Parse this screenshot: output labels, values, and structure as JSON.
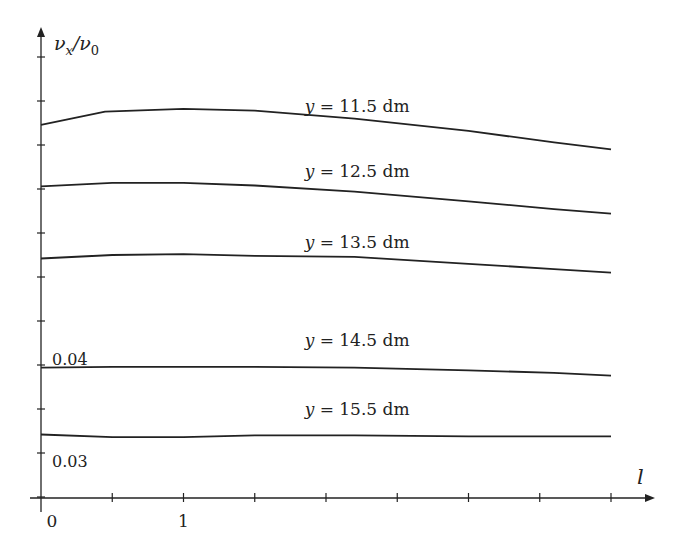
{
  "chart_data": {
    "type": "line",
    "title": "",
    "xlabel": "l",
    "ylabel": "v_x/v_0",
    "ylabel_parts": {
      "num": "ν",
      "num_sub": "x",
      "den": "ν",
      "den_sub": "0"
    },
    "x_tick_labels": [
      {
        "value": 0,
        "label": "0"
      },
      {
        "value": 1,
        "label": "1"
      }
    ],
    "x_ticks": [
      0.5,
      1,
      1.5,
      2,
      2.5,
      3,
      3.5,
      4
    ],
    "y_tick_labels": [
      {
        "value": 0.04,
        "label": "0.04"
      },
      {
        "value": 0.03,
        "label": "0.03"
      }
    ],
    "y_ticks": [
      0.025,
      0.03,
      0.035,
      0.04,
      0.045,
      0.05,
      0.055,
      0.06,
      0.065,
      0.07,
      0.075
    ],
    "xlim": [
      -0.1,
      4.45
    ],
    "ylim": [
      0.0236,
      0.0763
    ],
    "grid": false,
    "legend": "inline labels",
    "series": [
      {
        "name": "y = 11.5 dm",
        "label_pos": {
          "x": 1.85,
          "y": 0.0688
        },
        "x": [
          0,
          0.45,
          1.0,
          1.5,
          2.2,
          3.0,
          3.6,
          4.0
        ],
        "y": [
          0.0673,
          0.0688,
          0.0691,
          0.0689,
          0.068,
          0.0666,
          0.0653,
          0.0645
        ]
      },
      {
        "name": "y = 12.5 dm",
        "label_pos": {
          "x": 1.85,
          "y": 0.0614
        },
        "x": [
          0,
          0.5,
          1.0,
          1.5,
          2.2,
          3.0,
          3.6,
          4.0
        ],
        "y": [
          0.0603,
          0.0607,
          0.0607,
          0.0604,
          0.0597,
          0.0586,
          0.0577,
          0.0572
        ]
      },
      {
        "name": "y = 13.5 dm",
        "label_pos": {
          "x": 1.85,
          "y": 0.0533
        },
        "x": [
          0,
          0.5,
          1.0,
          1.5,
          2.2,
          3.0,
          3.6,
          4.0
        ],
        "y": [
          0.0521,
          0.0525,
          0.0526,
          0.0524,
          0.0523,
          0.0515,
          0.0509,
          0.0505
        ]
      },
      {
        "name": "y = 14.5 dm",
        "label_pos": {
          "x": 1.85,
          "y": 0.0422
        },
        "x": [
          0,
          0.5,
          1.0,
          1.5,
          2.2,
          3.0,
          3.6,
          4.0
        ],
        "y": [
          0.0397,
          0.0398,
          0.0398,
          0.0398,
          0.0397,
          0.0394,
          0.0391,
          0.0388
        ]
      },
      {
        "name": "y = 15.5 dm",
        "label_pos": {
          "x": 1.85,
          "y": 0.0343
        },
        "x": [
          0,
          0.5,
          1.0,
          1.5,
          2.2,
          3.0,
          3.6,
          4.0
        ],
        "y": [
          0.0321,
          0.0318,
          0.0318,
          0.032,
          0.032,
          0.0319,
          0.0319,
          0.0319
        ]
      }
    ]
  },
  "layout": {
    "origin_px": {
      "x": 41,
      "y": 498
    },
    "px_per_x_unit": 142.5,
    "y_ref": {
      "value": 0.03,
      "px": 453
    },
    "px_per_y_unit": 8800,
    "line_color": "#222222",
    "x_axis_end_px": 655,
    "y_axis_top_px": 27
  }
}
